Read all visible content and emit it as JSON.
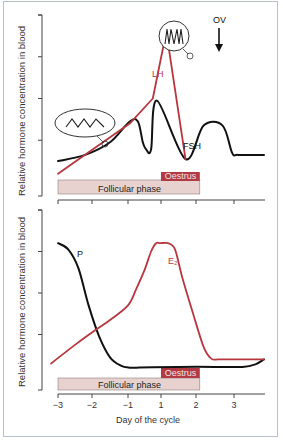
{
  "colors": {
    "red": "#b8373f",
    "black": "#111111",
    "follicular_fill": "#e7d2d0",
    "follicular_stroke": "#8e7f7f",
    "oestrus_fill": "#b23a44",
    "oestrus_text": "#f4e3e3"
  },
  "chart_data": [
    {
      "type": "line",
      "panel": "top",
      "title": "",
      "xlabel": "",
      "ylabel": "Relative hormone concentration in blood",
      "x_ticks": [
        -3,
        -2,
        -1,
        1,
        2,
        3
      ],
      "x_tick_labels_visible": false,
      "xlim": [
        -3,
        3.7
      ],
      "ylim": [
        0,
        4
      ],
      "y_ticks": [
        1,
        2,
        3,
        4
      ],
      "grid": false,
      "series": [
        {
          "name": "LH",
          "label": "LH",
          "color": "red",
          "x": [
            -3.0,
            -0.9,
            0.5,
            1.15,
            1.7
          ],
          "y": [
            0.2,
            1.4,
            2.0,
            3.6,
            0.55
          ]
        },
        {
          "name": "FSH",
          "label": "FSH",
          "color": "black",
          "x": [
            -3.0,
            -2.2,
            -1.5,
            -0.9,
            -0.4,
            -0.1,
            0.1,
            0.4,
            0.75,
            1.7,
            2.2,
            2.7,
            2.95,
            3.1,
            3.7
          ],
          "y": [
            0.5,
            0.65,
            0.95,
            1.45,
            1.45,
            0.95,
            0.78,
            0.78,
            1.95,
            0.55,
            1.35,
            1.35,
            0.7,
            0.65,
            0.65
          ]
        }
      ],
      "annotations": [
        {
          "text": "OV",
          "x": 1.95,
          "type": "arrow-down"
        },
        {
          "text": "LH pulses (high frequency)",
          "label": "",
          "type": "inset-circle",
          "at_x": 1.05
        },
        {
          "text": "LH pulses (low frequency)",
          "label": "",
          "type": "inset-ellipse",
          "at_x": -1.5
        }
      ],
      "phases": [
        {
          "label": "Follicular phase",
          "x_start": -3,
          "x_end": 2.1
        },
        {
          "label": "Oestrus",
          "x_start": 1,
          "x_end": 2.1
        }
      ]
    },
    {
      "type": "line",
      "panel": "bottom",
      "title": "",
      "xlabel": "Day of the cycle",
      "ylabel": "Relative hormone concentration in blood",
      "x_ticks": [
        -3,
        -2,
        -1,
        1,
        2,
        3
      ],
      "x_tick_labels": [
        "−3",
        "−2",
        "−1",
        "1",
        "2",
        "3"
      ],
      "xlim": [
        -3,
        3.7
      ],
      "ylim": [
        0,
        4
      ],
      "y_ticks": [
        1,
        2,
        3,
        4
      ],
      "grid": false,
      "series": [
        {
          "name": "P",
          "label": "P",
          "color": "black",
          "x": [
            -3.0,
            -2.7,
            -2.4,
            -2.1,
            -1.8,
            -1.5,
            -1.2,
            -0.9,
            -0.5,
            0.5,
            1.5,
            2.5,
            3.2,
            3.5,
            3.7
          ],
          "y": [
            3.2,
            3.05,
            2.6,
            1.7,
            0.95,
            0.45,
            0.25,
            0.2,
            0.2,
            0.21,
            0.22,
            0.22,
            0.22,
            0.28,
            0.4
          ]
        },
        {
          "name": "E2",
          "label": "E₂",
          "color": "red",
          "x": [
            -3.2,
            -2.5,
            -2.0,
            -1.5,
            -1.0,
            -0.5,
            0.0,
            0.4,
            0.7,
            0.95,
            1.2,
            1.4,
            1.6,
            1.9,
            2.2,
            2.4,
            2.6,
            3.0,
            3.7
          ],
          "y": [
            0.3,
            0.75,
            1.05,
            1.35,
            1.7,
            2.1,
            2.55,
            3.0,
            3.2,
            3.2,
            3.2,
            3.05,
            2.4,
            1.55,
            0.7,
            0.42,
            0.4,
            0.4,
            0.4
          ]
        }
      ],
      "phases": [
        {
          "label": "Follicular phase",
          "x_start": -3,
          "x_end": 2.1
        },
        {
          "label": "Oestrus",
          "x_start": 1,
          "x_end": 2.1
        }
      ]
    }
  ],
  "labels": {
    "ylabel_top": "Relative hormone concentration in blood",
    "ylabel_bottom": "Relative hormone concentration in blood",
    "xlabel": "Day of the cycle",
    "follicular_top": "Follicular phase",
    "follicular_bottom": "Follicular phase",
    "oestrus_top": "Oestrus",
    "oestrus_bottom": "Oestrus",
    "lh": "LH",
    "fsh": "FSH",
    "p": "P",
    "e2": "E₂",
    "ov": "OV"
  }
}
